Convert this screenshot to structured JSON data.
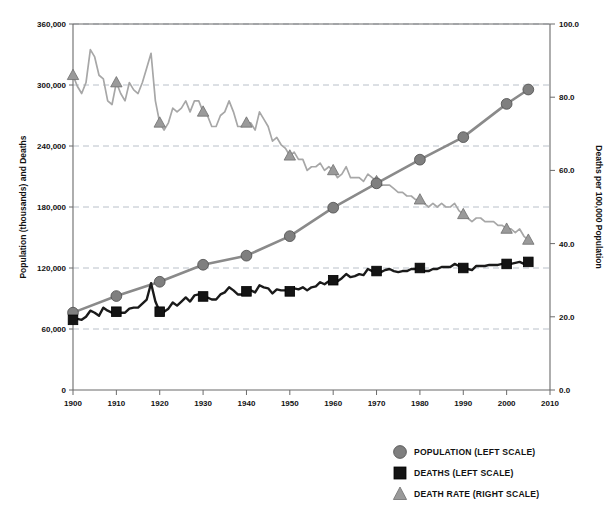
{
  "chart_data": {
    "type": "line",
    "title": "",
    "xlabel": "",
    "ylabel": "Population (thousands) and Deaths",
    "y2label": "Deaths per 100,000 Population",
    "xlim": [
      1900,
      2010
    ],
    "ylim": [
      0,
      360000
    ],
    "y2lim": [
      0.0,
      100.0
    ],
    "grid": true,
    "legend_position": "bottom-right",
    "x_ticks": [
      "1900",
      "1910",
      "1920",
      "1930",
      "1940",
      "1950",
      "1960",
      "1970",
      "1980",
      "1990",
      "2000",
      "2010"
    ],
    "y_ticks": [
      "0",
      "60,000",
      "120,000",
      "180,000",
      "240,000",
      "300,000",
      "360,000"
    ],
    "y2_ticks": [
      "0.0",
      "20.0",
      "40.0",
      "60.0",
      "80.0",
      "100.0"
    ],
    "legend": [
      {
        "label": "POPULATION (LEFT SCALE)",
        "marker": "circle",
        "color": "#7f7f7f"
      },
      {
        "label": "DEATHS (LEFT SCALE)",
        "marker": "square",
        "color": "#141414"
      },
      {
        "label": "DEATH RATE (RIGHT SCALE)",
        "marker": "triangle",
        "color": "#9a9a9a"
      }
    ],
    "series": [
      {
        "name": "POPULATION (LEFT SCALE)",
        "axis": "left",
        "marker": "circle",
        "color": "#8a8a8a",
        "marker_years": [
          1900,
          1910,
          1920,
          1930,
          1940,
          1950,
          1960,
          1970,
          1980,
          1990,
          2000,
          2005
        ],
        "x": [
          1900,
          1910,
          1920,
          1930,
          1940,
          1950,
          1960,
          1970,
          1980,
          1990,
          2000,
          2005
        ],
        "values": [
          76094,
          92407,
          106461,
          123188,
          132122,
          151325,
          179323,
          203302,
          226546,
          248710,
          281422,
          295561
        ]
      },
      {
        "name": "DEATHS (LEFT SCALE)",
        "axis": "left",
        "marker": "square",
        "color": "#141414",
        "marker_years": [
          1900,
          1910,
          1920,
          1930,
          1940,
          1950,
          1960,
          1970,
          1980,
          1990,
          2000,
          2005
        ],
        "x": [
          1900,
          1901,
          1902,
          1903,
          1904,
          1905,
          1906,
          1907,
          1908,
          1909,
          1910,
          1911,
          1912,
          1913,
          1914,
          1915,
          1916,
          1917,
          1918,
          1919,
          1920,
          1921,
          1922,
          1923,
          1924,
          1925,
          1926,
          1927,
          1928,
          1929,
          1930,
          1931,
          1932,
          1933,
          1934,
          1935,
          1936,
          1937,
          1938,
          1939,
          1940,
          1941,
          1942,
          1943,
          1944,
          1945,
          1946,
          1947,
          1948,
          1949,
          1950,
          1951,
          1952,
          1953,
          1954,
          1955,
          1956,
          1957,
          1958,
          1959,
          1960,
          1961,
          1962,
          1963,
          1964,
          1965,
          1966,
          1967,
          1968,
          1969,
          1970,
          1971,
          1972,
          1973,
          1974,
          1975,
          1976,
          1977,
          1978,
          1979,
          1980,
          1981,
          1982,
          1983,
          1984,
          1985,
          1986,
          1987,
          1988,
          1989,
          1990,
          1991,
          1992,
          1993,
          1994,
          1995,
          1996,
          1997,
          1998,
          1999,
          2000,
          2001,
          2002,
          2003,
          2004,
          2005
        ],
        "values": [
          69000,
          70000,
          69000,
          72000,
          78000,
          76000,
          73000,
          81000,
          78000,
          76000,
          77000,
          76000,
          76000,
          80000,
          81000,
          81000,
          85000,
          89000,
          105000,
          87000,
          77000,
          77000,
          80000,
          86000,
          83000,
          87000,
          91000,
          87000,
          93000,
          94000,
          92000,
          91000,
          89000,
          89000,
          94000,
          96000,
          101000,
          98000,
          94000,
          94000,
          97000,
          98000,
          96000,
          103000,
          101000,
          100000,
          95000,
          99000,
          98000,
          98000,
          97000,
          100000,
          99000,
          101000,
          98000,
          101000,
          102000,
          106000,
          104000,
          107000,
          108000,
          107000,
          110000,
          114000,
          111000,
          112000,
          114000,
          113000,
          119000,
          117000,
          117000,
          116000,
          118000,
          119000,
          117000,
          116000,
          117000,
          117000,
          119000,
          119000,
          120000,
          117000,
          117000,
          119000,
          119000,
          121000,
          121000,
          121000,
          124000,
          122000,
          120000,
          119000,
          118000,
          122000,
          122000,
          122000,
          123000,
          123000,
          123000,
          124000,
          124000,
          124000,
          125000,
          126000,
          124000,
          126000
        ]
      },
      {
        "name": "DEATH RATE (RIGHT SCALE)",
        "axis": "right",
        "marker": "triangle",
        "color": "#9a9a9a",
        "marker_years": [
          1900,
          1910,
          1920,
          1930,
          1940,
          1950,
          1960,
          1970,
          1980,
          1990,
          2000,
          2005
        ],
        "x": [
          1900,
          1901,
          1902,
          1903,
          1904,
          1905,
          1906,
          1907,
          1908,
          1909,
          1910,
          1911,
          1912,
          1913,
          1914,
          1915,
          1916,
          1917,
          1918,
          1919,
          1920,
          1921,
          1922,
          1923,
          1924,
          1925,
          1926,
          1927,
          1928,
          1929,
          1930,
          1931,
          1932,
          1933,
          1934,
          1935,
          1936,
          1937,
          1938,
          1939,
          1940,
          1941,
          1942,
          1943,
          1944,
          1945,
          1946,
          1947,
          1948,
          1949,
          1950,
          1951,
          1952,
          1953,
          1954,
          1955,
          1956,
          1957,
          1958,
          1959,
          1960,
          1961,
          1962,
          1963,
          1964,
          1965,
          1966,
          1967,
          1968,
          1969,
          1970,
          1971,
          1972,
          1973,
          1974,
          1975,
          1976,
          1977,
          1978,
          1979,
          1980,
          1981,
          1982,
          1983,
          1984,
          1985,
          1986,
          1987,
          1988,
          1989,
          1990,
          1991,
          1992,
          1993,
          1994,
          1995,
          1996,
          1997,
          1998,
          1999,
          2000,
          2001,
          2002,
          2003,
          2004,
          2005
        ],
        "values": [
          86.0,
          83.0,
          81.0,
          84.0,
          93.0,
          91.0,
          86.0,
          85.0,
          79.0,
          78.0,
          84.0,
          81.0,
          79.0,
          84.0,
          82.0,
          81.0,
          84.0,
          88.0,
          92.0,
          79.0,
          73.0,
          71.0,
          73.0,
          77.0,
          76.0,
          77.0,
          79.0,
          76.0,
          79.0,
          79.0,
          76.0,
          75.0,
          72.0,
          72.0,
          75.0,
          76.0,
          79.0,
          76.0,
          72.0,
          72.0,
          73.0,
          73.0,
          71.0,
          76.0,
          74.0,
          72.0,
          68.0,
          69.0,
          67.0,
          66.0,
          64.0,
          65.0,
          63.0,
          63.0,
          60.0,
          61.0,
          61.0,
          62.0,
          60.0,
          61.0,
          60.0,
          58.0,
          59.0,
          61.0,
          58.0,
          58.0,
          58.0,
          57.0,
          59.0,
          58.0,
          57.0,
          56.0,
          56.0,
          56.0,
          55.0,
          54.0,
          54.0,
          53.0,
          53.0,
          52.0,
          52.0,
          51.0,
          50.0,
          51.0,
          50.0,
          51.0,
          50.0,
          50.0,
          51.0,
          49.0,
          48.0,
          47.0,
          46.0,
          47.0,
          47.0,
          46.0,
          46.0,
          46.0,
          45.0,
          45.0,
          44.0,
          44.0,
          43.0,
          44.0,
          42.0,
          41.0
        ]
      }
    ]
  }
}
